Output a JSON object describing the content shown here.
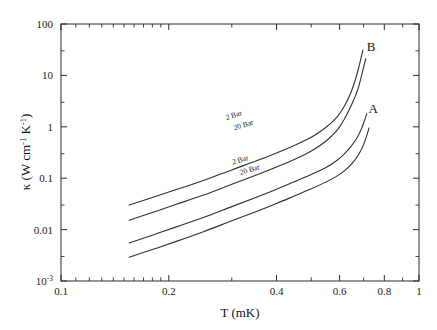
{
  "chart_data": {
    "type": "line",
    "title": "",
    "xlabel": "T (mK)",
    "ylabel": "κ (W cm⁻¹ K⁻¹)",
    "xlabel_parts": {
      "symbol": "T",
      "units": "(mK)"
    },
    "ylabel_parts": {
      "symbol": "κ",
      "open": " (W cm",
      "sup1": "-1",
      "mid": " K",
      "sup2": "-1",
      "close": ")"
    },
    "xscale": "log",
    "yscale": "log",
    "xlim": [
      0.1,
      1
    ],
    "ylim": [
      0.001,
      100
    ],
    "grid": false,
    "legend": "inline-annotations",
    "x_ticks": [
      {
        "value": 0.1,
        "label": "0.1"
      },
      {
        "value": 0.2,
        "label": "0.2"
      },
      {
        "value": 0.3,
        "label": ""
      },
      {
        "value": 0.4,
        "label": "0.4"
      },
      {
        "value": 0.5,
        "label": ""
      },
      {
        "value": 0.6,
        "label": "0.6"
      },
      {
        "value": 0.7,
        "label": ""
      },
      {
        "value": 0.8,
        "label": "0.8"
      },
      {
        "value": 0.9,
        "label": ""
      },
      {
        "value": 1.0,
        "label": "1"
      }
    ],
    "y_ticks": [
      {
        "value": 100,
        "label": "100",
        "sup": ""
      },
      {
        "value": 10,
        "label": "10",
        "sup": ""
      },
      {
        "value": 1,
        "label": "1",
        "sup": ""
      },
      {
        "value": 0.1,
        "label": "0.1",
        "sup": ""
      },
      {
        "value": 0.01,
        "label": "0.01",
        "sup": ""
      },
      {
        "value": 0.001,
        "label": "10",
        "sup": "-3"
      }
    ],
    "annotations": [
      {
        "text": "B",
        "x": 0.735,
        "y": 30.0,
        "name": "curve-label-b"
      },
      {
        "text": "A",
        "x": 0.745,
        "y": 1.85,
        "name": "curve-label-a"
      },
      {
        "text": "2 Bar",
        "x": 0.305,
        "y": 1.52,
        "rotate": -17,
        "name": "series-label-b-2bar"
      },
      {
        "text": "20 Bar",
        "x": 0.325,
        "y": 0.98,
        "rotate": -17,
        "name": "series-label-b-20bar"
      },
      {
        "text": "2 Bar",
        "x": 0.318,
        "y": 0.205,
        "rotate": -17,
        "name": "series-label-a-2bar"
      },
      {
        "text": "20 Bar",
        "x": 0.338,
        "y": 0.132,
        "rotate": -17,
        "name": "series-label-a-20bar"
      }
    ],
    "series": [
      {
        "name": "B 2 Bar",
        "branch": "B",
        "pressure": "2 Bar",
        "x": [
          0.155,
          0.18,
          0.21,
          0.25,
          0.3,
          0.35,
          0.4,
          0.45,
          0.48,
          0.51,
          0.55,
          0.59,
          0.62,
          0.645,
          0.665,
          0.68,
          0.69,
          0.697
        ],
        "y": [
          0.03,
          0.042,
          0.06,
          0.09,
          0.145,
          0.215,
          0.31,
          0.44,
          0.54,
          0.68,
          0.98,
          1.55,
          2.6,
          4.6,
          8.5,
          15.0,
          23.0,
          31.0
        ]
      },
      {
        "name": "B 20 Bar",
        "branch": "B",
        "pressure": "20 Bar",
        "x": [
          0.155,
          0.18,
          0.21,
          0.25,
          0.3,
          0.35,
          0.4,
          0.45,
          0.48,
          0.51,
          0.55,
          0.59,
          0.62,
          0.65,
          0.675,
          0.69,
          0.702,
          0.71
        ],
        "y": [
          0.0152,
          0.0215,
          0.031,
          0.047,
          0.076,
          0.114,
          0.165,
          0.235,
          0.29,
          0.365,
          0.53,
          0.85,
          1.45,
          2.8,
          5.4,
          9.5,
          15.5,
          21.0
        ]
      },
      {
        "name": "A 2 Bar",
        "branch": "A",
        "pressure": "2 Bar",
        "x": [
          0.155,
          0.18,
          0.21,
          0.25,
          0.3,
          0.35,
          0.4,
          0.45,
          0.5,
          0.545,
          0.575,
          0.61,
          0.645,
          0.672,
          0.69,
          0.705,
          0.715
        ],
        "y": [
          0.0055,
          0.0078,
          0.0113,
          0.0172,
          0.028,
          0.042,
          0.061,
          0.086,
          0.118,
          0.156,
          0.195,
          0.27,
          0.41,
          0.62,
          0.9,
          1.35,
          1.8
        ]
      },
      {
        "name": "A 20 Bar",
        "branch": "A",
        "pressure": "20 Bar",
        "x": [
          0.155,
          0.18,
          0.21,
          0.25,
          0.3,
          0.35,
          0.4,
          0.45,
          0.5,
          0.545,
          0.585,
          0.62,
          0.655,
          0.682,
          0.7,
          0.715,
          0.725
        ],
        "y": [
          0.0029,
          0.0041,
          0.0059,
          0.0091,
          0.0148,
          0.0222,
          0.0322,
          0.0455,
          0.062,
          0.082,
          0.106,
          0.14,
          0.205,
          0.31,
          0.45,
          0.68,
          0.95
        ]
      }
    ]
  }
}
